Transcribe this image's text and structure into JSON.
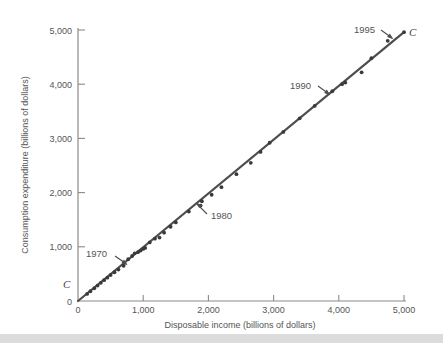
{
  "chart_data": {
    "type": "scatter",
    "title": "",
    "xlabel": "Disposable income (billions of dollars)",
    "ylabel": "Consumption expenditure (billions of dollars)",
    "xlim": [
      0,
      5400
    ],
    "ylim": [
      0,
      5400
    ],
    "xticks": [
      0,
      1000,
      2000,
      3000,
      4000,
      5000
    ],
    "yticks": [
      0,
      1000,
      2000,
      3000,
      4000,
      5000
    ],
    "xticklabels": [
      "0",
      "1,000",
      "2,000",
      "3,000",
      "4,000",
      "5,000"
    ],
    "yticklabels": [
      "0",
      "1,000",
      "2,000",
      "3,000",
      "4,000",
      "5,000"
    ],
    "grid": false,
    "legend": "none",
    "series_name": "C",
    "series_label_positions": [
      "origin",
      "upper-right-end"
    ],
    "annotations": [
      {
        "text": "1970",
        "points_to_x": 700,
        "points_to_y": 650
      },
      {
        "text": "1980",
        "points_to_x": 1900,
        "points_to_y": 1790
      },
      {
        "text": "1990",
        "points_to_x": 3900,
        "points_to_y": 3870
      },
      {
        "text": "1995",
        "points_to_x": 4850,
        "points_to_y": 4820
      }
    ],
    "fit_line": {
      "from_x": 0,
      "from_y": 0,
      "to_x": 5000,
      "to_y": 4960
    },
    "points": [
      {
        "x": 140,
        "y": 130
      },
      {
        "x": 190,
        "y": 180
      },
      {
        "x": 250,
        "y": 235
      },
      {
        "x": 300,
        "y": 285
      },
      {
        "x": 350,
        "y": 335
      },
      {
        "x": 400,
        "y": 385
      },
      {
        "x": 450,
        "y": 430
      },
      {
        "x": 500,
        "y": 480
      },
      {
        "x": 560,
        "y": 530
      },
      {
        "x": 620,
        "y": 580
      },
      {
        "x": 700,
        "y": 650
      },
      {
        "x": 770,
        "y": 770
      },
      {
        "x": 830,
        "y": 830
      },
      {
        "x": 870,
        "y": 880
      },
      {
        "x": 920,
        "y": 900
      },
      {
        "x": 960,
        "y": 930
      },
      {
        "x": 1000,
        "y": 960
      },
      {
        "x": 1030,
        "y": 980
      },
      {
        "x": 1100,
        "y": 1080
      },
      {
        "x": 1180,
        "y": 1150
      },
      {
        "x": 1250,
        "y": 1170
      },
      {
        "x": 1320,
        "y": 1260
      },
      {
        "x": 1420,
        "y": 1370
      },
      {
        "x": 1500,
        "y": 1450
      },
      {
        "x": 1700,
        "y": 1650
      },
      {
        "x": 1880,
        "y": 1760
      },
      {
        "x": 1900,
        "y": 1840
      },
      {
        "x": 2050,
        "y": 1960
      },
      {
        "x": 2200,
        "y": 2100
      },
      {
        "x": 2430,
        "y": 2340
      },
      {
        "x": 2650,
        "y": 2550
      },
      {
        "x": 2800,
        "y": 2750
      },
      {
        "x": 2940,
        "y": 2920
      },
      {
        "x": 3150,
        "y": 3120
      },
      {
        "x": 3400,
        "y": 3370
      },
      {
        "x": 3630,
        "y": 3600
      },
      {
        "x": 3900,
        "y": 3870
      },
      {
        "x": 4050,
        "y": 4000
      },
      {
        "x": 4100,
        "y": 4030
      },
      {
        "x": 4350,
        "y": 4220
      },
      {
        "x": 4500,
        "y": 4480
      },
      {
        "x": 4750,
        "y": 4800
      },
      {
        "x": 5000,
        "y": 4960
      }
    ]
  },
  "axis": {
    "y_title": "Consumption expenditure (billions of dollars)",
    "x_title": "Disposable income (billions of dollars)",
    "y_labels": [
      "5,000",
      "4,000",
      "3,000",
      "2,000",
      "1,000",
      "0"
    ],
    "x_labels": [
      "0",
      "1,000",
      "2,000",
      "3,000",
      "4,000",
      "5,000"
    ]
  },
  "annotations": {
    "y1970": "1970",
    "y1980": "1980",
    "y1990": "1990",
    "y1995": "1995",
    "curve_label_origin": "C",
    "curve_label_end": "C"
  },
  "colors": {
    "line": "#4d4d4d",
    "point": "#3a3a3a",
    "axis": "#8a8a8a",
    "text": "#555555",
    "band": "#dcdcdc",
    "background": "#ffffff"
  }
}
